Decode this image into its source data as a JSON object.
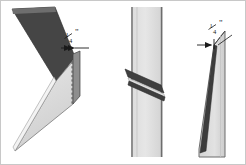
{
  "figure": {
    "background_color": "#ffffff",
    "border_color": "#c8c8c8",
    "panel_count": 3
  },
  "colors": {
    "dark_metal": "#454545",
    "dark_metal_edge": "#2f2f2f",
    "light_metal": "#d9d9d9",
    "light_metal_alt": "#e4e4e4",
    "mid_metal": "#b4b4b4",
    "outline": "#555555",
    "dimension_line": "#1a1a1a",
    "dashed_line": "#5a5a5a"
  },
  "panels": [
    {
      "id": "panel-left",
      "name": "isometric-view",
      "description": "Isometric view of V-shaped flashing with upper dark flange and lower light flange meeting at a vertical end edge",
      "dimension": {
        "value": "1/4",
        "numerator": "1",
        "denominator": "4",
        "unit": "\"",
        "display": "¼\""
      }
    },
    {
      "id": "panel-middle",
      "name": "front-elevation-view",
      "description": "Vertical strip with dark diagonal flashing piece crossing through it",
      "dimension": null
    },
    {
      "id": "panel-right",
      "name": "edge-profile-view",
      "description": "Edge profile view of tapered flashing with gap dimension at top",
      "dimension": {
        "value": "1/4",
        "numerator": "1",
        "denominator": "4",
        "unit": "\"",
        "display": "¼\""
      }
    }
  ],
  "labels": {
    "left_quarter_inch": "¼\"",
    "right_quarter_inch": "¼\"",
    "left_numerator": "1",
    "left_denominator": "4",
    "left_unit": "\"",
    "right_numerator": "1",
    "right_denominator": "4",
    "right_unit": "\""
  }
}
